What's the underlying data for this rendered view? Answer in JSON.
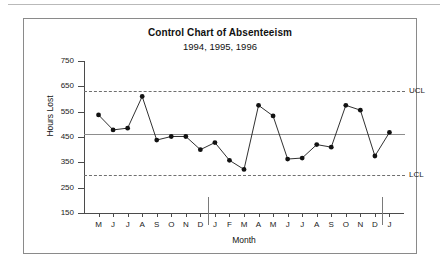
{
  "figure": {
    "title": "Control Chart of Absenteeism",
    "subtitle": "1994, 1995, 1996"
  },
  "chart_data": {
    "type": "line",
    "title": "Control Chart of Absenteeism",
    "subtitle": "1994, 1995, 1996",
    "xlabel": "Month",
    "ylabel": "Hours Lost",
    "ylim": [
      150,
      750
    ],
    "yticks": [
      750,
      650,
      550,
      450,
      350,
      250,
      150
    ],
    "grid": false,
    "legend": null,
    "categories": [
      "M",
      "J",
      "J",
      "A",
      "S",
      "O",
      "N",
      "D",
      "J",
      "F",
      "M",
      "A",
      "M",
      "J",
      "J",
      "A",
      "S",
      "O",
      "N",
      "D",
      "J"
    ],
    "values": [
      537,
      478,
      485,
      610,
      438,
      452,
      452,
      400,
      428,
      358,
      322,
      575,
      533,
      363,
      367,
      420,
      410,
      575,
      556,
      375,
      468
    ],
    "series": [
      {
        "name": "Hours Lost",
        "values": [
          537,
          478,
          485,
          610,
          438,
          452,
          452,
          400,
          428,
          358,
          322,
          575,
          533,
          363,
          367,
          420,
          410,
          575,
          556,
          375,
          468
        ]
      }
    ],
    "reference_lines": [
      {
        "name": "UCL",
        "label": "UCL",
        "value": 630,
        "style": "dashed"
      },
      {
        "name": "center",
        "label": "",
        "value": 462,
        "style": "solid"
      },
      {
        "name": "LCL",
        "label": "LCL",
        "value": 300,
        "style": "dashed"
      }
    ],
    "year_dividers": [
      {
        "after_index": 7
      },
      {
        "after_index": 19
      }
    ],
    "annotations": [
      {
        "text": "UCL",
        "value": 630
      },
      {
        "text": "LCL",
        "value": 300
      }
    ]
  },
  "axis": {
    "y_tick_labels": [
      "750",
      "650",
      "550",
      "450",
      "350",
      "250",
      "150"
    ],
    "x_tick_labels": [
      "M",
      "J",
      "J",
      "A",
      "S",
      "O",
      "N",
      "D",
      "J",
      "F",
      "M",
      "A",
      "M",
      "J",
      "J",
      "A",
      "S",
      "O",
      "N",
      "D",
      "J"
    ],
    "y_title": "Hours Lost",
    "x_title": "Month"
  },
  "limits": {
    "ucl_label": "UCL",
    "lcl_label": "LCL"
  },
  "colors": {
    "line": "#1a1a1a",
    "marker": "#121212",
    "center_line": "#8d8d8d",
    "limit_line": "#6f6f6f",
    "axis": "#4b4b4b",
    "frame": "#8a8a8a",
    "background": "#ffffff"
  }
}
